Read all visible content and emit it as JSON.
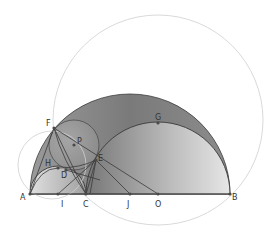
{
  "diagram": {
    "colors": {
      "background": "#ffffff",
      "big_semicircle": "#7d7d7d",
      "right_semicircle": "#c8c8c8",
      "left_semicircle": "#cfcfcf",
      "stroke": "#3a3a3a",
      "faint_circle": "#c8c8c8",
      "point": "#4a4a4a"
    },
    "points": [
      {
        "id": "A",
        "label": "A",
        "x": 30,
        "y": 194,
        "lx": 20,
        "ly": 200
      },
      {
        "id": "B",
        "label": "B",
        "x": 230,
        "y": 194,
        "lx": 232,
        "ly": 200
      },
      {
        "id": "C",
        "label": "C",
        "x": 86,
        "y": 194,
        "lx": 83,
        "ly": 207
      },
      {
        "id": "I",
        "label": "I",
        "x": 58,
        "y": 194,
        "lx": 61,
        "ly": 207
      },
      {
        "id": "J",
        "label": "J",
        "x": 130,
        "y": 194,
        "lx": 127,
        "ly": 207
      },
      {
        "id": "O",
        "label": "O",
        "x": 158,
        "y": 194,
        "lx": 155,
        "ly": 207
      },
      {
        "id": "F",
        "label": "F",
        "x": 54,
        "y": 128,
        "lx": 46,
        "ly": 126
      },
      {
        "id": "G",
        "label": "G",
        "x": 158,
        "y": 123,
        "lx": 155,
        "ly": 120
      },
      {
        "id": "P",
        "label": "P",
        "x": 74,
        "y": 145,
        "lx": 77,
        "ly": 144
      },
      {
        "id": "E",
        "label": "E",
        "x": 96,
        "y": 160,
        "lx": 98,
        "ly": 161
      },
      {
        "id": "H",
        "label": "H",
        "x": 58,
        "y": 168,
        "lx": 45,
        "ly": 166
      },
      {
        "id": "D",
        "label": "D",
        "x": 66,
        "y": 170,
        "lx": 61,
        "ly": 178
      }
    ]
  }
}
